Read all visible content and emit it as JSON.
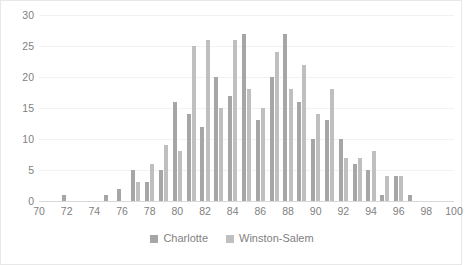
{
  "chart_data": {
    "type": "bar",
    "title": "",
    "subtitle": "",
    "xlabel": "",
    "ylabel": "",
    "grid": false,
    "legend_position": "bottom",
    "xlim": [
      70,
      100
    ],
    "ylim": [
      0,
      30
    ],
    "y_ticks": [
      0,
      5,
      10,
      15,
      20,
      25,
      30
    ],
    "x_ticks": [
      70,
      72,
      74,
      76,
      78,
      80,
      82,
      84,
      86,
      88,
      90,
      92,
      94,
      96,
      98,
      100
    ],
    "categories": [
      72,
      73,
      74,
      75,
      76,
      77,
      78,
      79,
      80,
      81,
      82,
      83,
      84,
      85,
      86,
      87,
      88,
      89,
      90,
      91,
      92,
      93,
      94,
      95,
      96,
      97
    ],
    "series": [
      {
        "name": "Charlotte",
        "color": "#a6a6a6",
        "values": [
          1,
          0,
          0,
          1,
          2,
          5,
          3,
          5,
          16,
          14,
          12,
          20,
          17,
          27,
          13,
          20,
          27,
          16,
          10,
          13,
          10,
          6,
          5,
          1,
          4,
          1
        ]
      },
      {
        "name": "Winston-Salem",
        "color": "#bfbfbf",
        "values": [
          0,
          0,
          0,
          0,
          0,
          3,
          6,
          9,
          8,
          25,
          26,
          15,
          26,
          18,
          15,
          24,
          18,
          22,
          14,
          18,
          7,
          7,
          8,
          4,
          4,
          0
        ]
      }
    ]
  },
  "legend": {
    "items": [
      {
        "label": "Charlotte"
      },
      {
        "label": "Winston-Salem"
      }
    ]
  }
}
